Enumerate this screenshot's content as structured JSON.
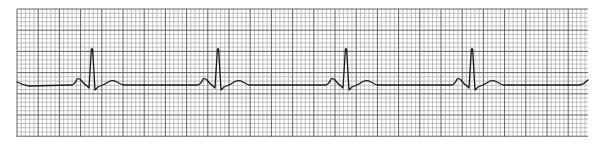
{
  "chart_data": {
    "type": "line",
    "title": "",
    "subtitle": "",
    "xlabel": "",
    "ylabel": "",
    "grid": {
      "on": true,
      "minor_spacing_px": 4.24,
      "major_every": 5,
      "left": 17,
      "top": 9,
      "right": 588,
      "bottom": 137,
      "minor_color": "#9a9a9a",
      "major_color": "#555555"
    },
    "trace": {
      "color": "#1a1a1a",
      "baseline_y": 85,
      "start_x": 17,
      "end_x": 588
    },
    "beats": [
      {
        "index": 1,
        "p_peak_x": 79,
        "r_peak_x": 92,
        "t_peak_x": 113
      },
      {
        "index": 2,
        "p_peak_x": 205,
        "r_peak_x": 218,
        "t_peak_x": 239
      },
      {
        "index": 3,
        "p_peak_x": 333,
        "r_peak_x": 346,
        "t_peak_x": 367
      },
      {
        "index": 4,
        "p_peak_x": 459,
        "r_peak_x": 472,
        "t_peak_x": 493
      }
    ],
    "waveform_template": {
      "p_wave": {
        "start_dx": -20,
        "peak_dx": -13,
        "end_dx": -6,
        "amplitude_px": 6
      },
      "q_wave": {
        "dx": -3,
        "depth_px": 3
      },
      "r_wave": {
        "dx": 0,
        "peak_y": 49
      },
      "s_wave": {
        "dx": 3,
        "trough_y": 90
      },
      "t_wave": {
        "start_dx": 8,
        "peak_dx": 21,
        "end_dx": 32,
        "amplitude_px": 4
      }
    },
    "rr_interval_px": 127,
    "rhythm": "regular",
    "beat_count_complete": 4,
    "trailing_partial_p_wave": true
  }
}
